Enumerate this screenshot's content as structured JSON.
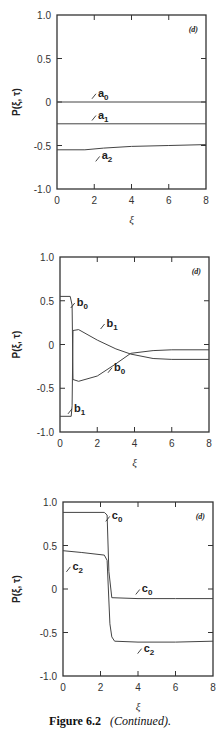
{
  "figure": {
    "caption_label": "Figure 6.2",
    "caption_text": "(Continued)."
  },
  "chart_data": [
    {
      "type": "line",
      "panel": "(d)",
      "xlabel": "ξ",
      "ylabel": "P(ξ, τ)",
      "xlim": [
        0,
        8
      ],
      "ylim": [
        -1.0,
        1.0
      ],
      "xticks": [
        "0",
        "2",
        "4",
        "6",
        "8"
      ],
      "yticks": [
        "1.0",
        "0.5",
        "0",
        "-0.5",
        "-1.0"
      ],
      "grid": false,
      "series": [
        {
          "name": "a0",
          "x": [
            0,
            8
          ],
          "y": [
            0.0,
            0.0
          ]
        },
        {
          "name": "a1",
          "x": [
            0,
            8
          ],
          "y": [
            -0.25,
            -0.25
          ]
        },
        {
          "name": "a2",
          "x": [
            0,
            1.5,
            2.5,
            4,
            6,
            8
          ],
          "y": [
            -0.55,
            -0.55,
            -0.53,
            -0.51,
            -0.5,
            -0.49
          ]
        }
      ]
    },
    {
      "type": "line",
      "panel": "(d)",
      "xlabel": "ξ",
      "ylabel": "P(ξ, τ)",
      "xlim": [
        0,
        8
      ],
      "ylim": [
        -1.0,
        1.0
      ],
      "xticks": [
        "0",
        "2",
        "4",
        "6",
        "8"
      ],
      "yticks": [
        "1.0",
        "0.5",
        "0",
        "-0.5",
        "-1.0"
      ],
      "grid": false,
      "series": [
        {
          "name": "b0",
          "x": [
            0,
            0.55,
            0.65,
            0.7,
            1.0,
            2,
            3,
            3.8,
            5,
            6,
            8
          ],
          "y": [
            0.55,
            0.55,
            0.45,
            -0.4,
            -0.42,
            -0.36,
            -0.22,
            -0.1,
            -0.07,
            -0.06,
            -0.06
          ]
        },
        {
          "name": "b1",
          "x": [
            0,
            0.6,
            0.65,
            0.7,
            1.0,
            2,
            3,
            3.8,
            5,
            6,
            8
          ],
          "y": [
            -0.82,
            -0.82,
            -0.7,
            0.16,
            0.17,
            0.05,
            -0.05,
            -0.11,
            -0.16,
            -0.17,
            -0.17
          ]
        }
      ]
    },
    {
      "type": "line",
      "panel": "(d)",
      "xlabel": "ξ",
      "ylabel": "P(ξ, τ)",
      "xlim": [
        0,
        8
      ],
      "ylim": [
        -1.0,
        1.0
      ],
      "xticks": [
        "0",
        "2",
        "4",
        "6",
        "8"
      ],
      "yticks": [
        "1.0",
        "0.5",
        "0",
        "-0.5",
        "-1.0"
      ],
      "grid": false,
      "series": [
        {
          "name": "c0",
          "x": [
            0,
            2.2,
            2.35,
            2.45,
            2.6,
            4,
            6,
            8
          ],
          "y": [
            0.88,
            0.88,
            0.85,
            0.2,
            -0.1,
            -0.11,
            -0.11,
            -0.11
          ]
        },
        {
          "name": "c2",
          "x": [
            0,
            1,
            2.2,
            2.35,
            2.5,
            2.6,
            2.75,
            4,
            6,
            8
          ],
          "y": [
            0.44,
            0.42,
            0.39,
            0.33,
            -0.4,
            -0.55,
            -0.6,
            -0.61,
            -0.61,
            -0.6
          ]
        }
      ]
    }
  ],
  "labels": {
    "top": [
      {
        "text": "a",
        "sub": "0",
        "x": 2.2,
        "y": 0.06
      },
      {
        "text": "a",
        "sub": "1",
        "x": 2.2,
        "y": -0.19
      },
      {
        "text": "a",
        "sub": "2",
        "x": 2.4,
        "y": -0.66
      }
    ],
    "middle": [
      {
        "text": "b",
        "sub": "0",
        "x": 0.9,
        "y": 0.44
      },
      {
        "text": "b",
        "sub": "1",
        "x": 2.5,
        "y": 0.2
      },
      {
        "text": "b",
        "sub": "0",
        "x": 2.9,
        "y": -0.3
      },
      {
        "text": "b",
        "sub": "1",
        "x": 0.75,
        "y": -0.77
      }
    ],
    "bottom": [
      {
        "text": "c",
        "sub": "0",
        "x": 2.6,
        "y": 0.8
      },
      {
        "text": "c",
        "sub": "2",
        "x": 0.5,
        "y": 0.22
      },
      {
        "text": "c",
        "sub": "0",
        "x": 4.2,
        "y": -0.04
      },
      {
        "text": "c",
        "sub": "2",
        "x": 4.3,
        "y": -0.72
      }
    ]
  }
}
